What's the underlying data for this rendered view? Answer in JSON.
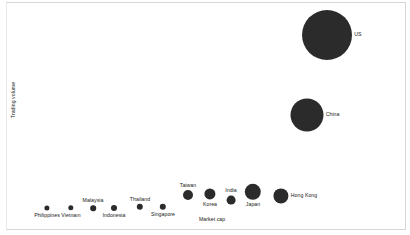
{
  "chart_data": {
    "type": "scatter",
    "title": "",
    "xlabel": "Market cap",
    "ylabel": "Trading volume",
    "grid": false,
    "legend": "none",
    "axis_ticks": false,
    "bubble_color": "#2b2b2b",
    "background": "#ffffff",
    "points": [
      {
        "label": "Philippines",
        "x": 47,
        "y": 208,
        "r": 2.6,
        "label_pos": "below"
      },
      {
        "label": "Vietnam",
        "x": 71,
        "y": 208,
        "r": 2.7,
        "label_pos": "below"
      },
      {
        "label": "Malaysia",
        "x": 93,
        "y": 208,
        "r": 2.8,
        "label_pos": "above"
      },
      {
        "label": "Indonesia",
        "x": 114,
        "y": 208,
        "r": 3.0,
        "label_pos": "below"
      },
      {
        "label": "Thailand",
        "x": 140,
        "y": 207,
        "r": 3.2,
        "label_pos": "above"
      },
      {
        "label": "Singapore",
        "x": 163,
        "y": 207,
        "r": 3.2,
        "label_pos": "below"
      },
      {
        "label": "Taiwan",
        "x": 188,
        "y": 195,
        "r": 5.0,
        "label_pos": "above"
      },
      {
        "label": "Korea",
        "x": 210,
        "y": 194,
        "r": 5.6,
        "label_pos": "below"
      },
      {
        "label": "India",
        "x": 231,
        "y": 200,
        "r": 4.4,
        "label_pos": "above"
      },
      {
        "label": "Japan",
        "x": 253,
        "y": 192,
        "r": 8.2,
        "label_pos": "below"
      },
      {
        "label": "Hong Kong",
        "x": 281,
        "y": 196,
        "r": 7.6,
        "label_pos": "right"
      },
      {
        "label": "China",
        "x": 307,
        "y": 115,
        "r": 16.5,
        "label_pos": "right"
      },
      {
        "label": "US",
        "x": 327,
        "y": 35,
        "r": 25.0,
        "label_pos": "right"
      }
    ]
  },
  "axes": {
    "y_title": "Trading volume",
    "x_title": "Market cap"
  },
  "caption": {
    "clipped_text": ""
  }
}
